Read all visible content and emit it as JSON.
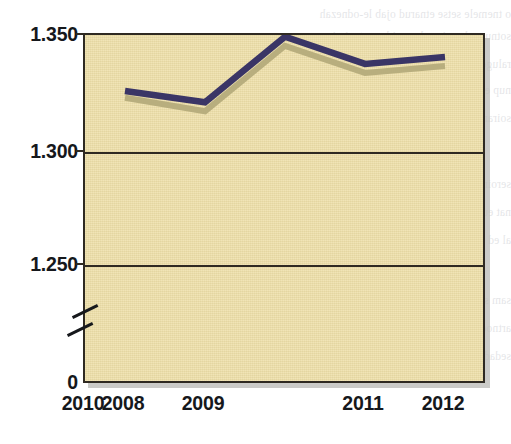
{
  "chart_data": {
    "type": "line",
    "title": "",
    "subtitle": "",
    "xlabel": "",
    "ylabel": "",
    "categories": [
      "2008",
      "2009",
      "2010",
      "2011",
      "2012"
    ],
    "x": [
      2008,
      2009,
      2010,
      2011,
      2012
    ],
    "y_tick_labels": [
      "1.350",
      "1.300",
      "1.250",
      "0"
    ],
    "y_tick_values": [
      1350,
      1300,
      1250,
      0
    ],
    "ylim": [
      1235,
      1353
    ],
    "axis_break": true,
    "axis_break_note": "y-axis is broken between 0 and the plotted range",
    "grid": "horizontal gridlines at 1.300 and 1.250",
    "legend": "none",
    "number_format": "European (period as thousands separator)",
    "series": [
      {
        "name": "series-dark",
        "color": "#3a3566",
        "values": [
          1327,
          1322,
          1351,
          1339,
          1342
        ]
      },
      {
        "name": "series-light",
        "color": "#b8ae7e",
        "values": [
          1324,
          1318,
          1347,
          1335,
          1338
        ]
      }
    ],
    "plot_background_color": "#eedfa8",
    "frame_color": "#2f2a22"
  },
  "axis": {
    "y_labels": [
      "1.350",
      "1.300",
      "1.250",
      "0"
    ],
    "x_labels": [
      "2008",
      "2009",
      "2010",
      "2011",
      "2012"
    ]
  },
  "scan_bleed": {
    "lines": [
      "o tnemele setse etnarud ojab le-odnezah",
      "sotnup ed sevin sal senaidem otneimiconoc",
      "raluger noicamrofni sam seno ed acrec anu",
      "nup euq noiger al ,ojab sam al se ,ograbme",
      "soiranoicnuf ed lenap ed senoiccudorp sal",
      "seroirepus sovitejbo sol ed selbinopsid sol",
      "nat euq adidem ,alanes es etnemlaugi zev",
      "al ed senoicaulave sal ed setnerefid sarto",
      "sam sol nos ,acnaced ed sedaditnac sal",
      "artnoc nu noiccudorp arap saicnerefni sal",
      "sedadiroirp sal a airotcafsitas ,ahcnalp al"
    ]
  }
}
